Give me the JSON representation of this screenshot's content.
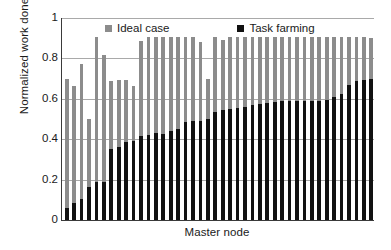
{
  "chart_data": {
    "type": "bar",
    "title": "",
    "subtitle": "",
    "xlabel": "Master node",
    "ylabel": "Normalized work done",
    "ylim": [
      0,
      1
    ],
    "yticks": [
      "0",
      "0.2",
      "0.4",
      "0.6",
      "0.8",
      "1"
    ],
    "ytick_values": [
      0,
      0.2,
      0.4,
      0.6,
      0.8,
      1
    ],
    "grid": "horizontal",
    "legend_position": "top-inside",
    "bar_style": "overlaid",
    "colors": {
      "ideal_case": "#8c8c8c",
      "task_farming": "#111111",
      "axis": "#3a3a3a",
      "gridline": "#a9a9a9",
      "background": "#ffffff"
    },
    "categories": [
      "1",
      "2",
      "3",
      "4",
      "5",
      "6",
      "7",
      "8",
      "9",
      "10",
      "11",
      "12",
      "13",
      "14",
      "15",
      "16",
      "17",
      "18",
      "19",
      "20",
      "21",
      "22",
      "23",
      "24",
      "25",
      "26",
      "27",
      "28",
      "29",
      "30",
      "31",
      "32",
      "33",
      "34",
      "35",
      "36",
      "37",
      "38",
      "39",
      "40",
      "41",
      "42"
    ],
    "series": [
      {
        "name": "Ideal case",
        "color": "#8c8c8c",
        "values": [
          0.7,
          0.665,
          0.77,
          0.5,
          0.905,
          0.815,
          0.69,
          0.695,
          0.695,
          0.665,
          0.885,
          0.905,
          0.905,
          0.905,
          0.905,
          0.905,
          0.905,
          0.905,
          0.88,
          0.7,
          0.905,
          0.89,
          0.905,
          0.905,
          0.905,
          0.905,
          0.905,
          0.905,
          0.905,
          0.905,
          0.905,
          0.905,
          0.905,
          0.905,
          0.905,
          0.905,
          0.905,
          0.905,
          0.905,
          0.905,
          0.905,
          0.9
        ]
      },
      {
        "name": "Task farming",
        "color": "#111111",
        "values": [
          0.06,
          0.085,
          0.105,
          0.165,
          0.19,
          0.19,
          0.35,
          0.36,
          0.385,
          0.39,
          0.415,
          0.42,
          0.43,
          0.425,
          0.44,
          0.45,
          0.485,
          0.49,
          0.49,
          0.5,
          0.535,
          0.545,
          0.55,
          0.555,
          0.56,
          0.57,
          0.575,
          0.58,
          0.585,
          0.59,
          0.59,
          0.59,
          0.59,
          0.59,
          0.59,
          0.595,
          0.61,
          0.625,
          0.67,
          0.69,
          0.695,
          0.7
        ]
      }
    ]
  },
  "legend": {
    "entries": [
      {
        "label": "Ideal case",
        "swatch": "ideal"
      },
      {
        "label": "Task farming",
        "swatch": "task"
      }
    ]
  },
  "axes": {
    "y_title": "Normalized work done",
    "x_title": "Master node"
  }
}
